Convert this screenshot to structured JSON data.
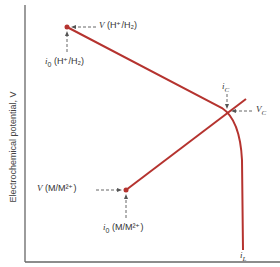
{
  "diagram": {
    "y_axis_label": "Electrochemical potential, V",
    "labels": {
      "v_h": "V (H⁺/H₂)",
      "i0_h": "i₀ (H⁺/H₂)",
      "ic": "i_C",
      "vc": "V_C",
      "v_m": "V (M/M²⁺)",
      "i0_m": "i₀ (M/M²⁺)",
      "il": "i_L"
    },
    "label_parts": {
      "v_h_v": "V",
      "v_h_rest": " (H⁺/H₂)",
      "i0_h_i": "i",
      "i0_h_sub": "0",
      "i0_h_rest": " (H⁺/H₂)",
      "ic_i": "i",
      "ic_sub": "C",
      "vc_v": "V",
      "vc_sub": "C",
      "v_m_v": "V",
      "v_m_rest": " (M/M²⁺)",
      "i0_m_i": "i",
      "i0_m_sub": "0",
      "i0_m_rest": " (M/M²⁺)",
      "il_i": "i",
      "il_sub": "L"
    },
    "colors": {
      "curve": "#b5332f",
      "axis": "#555555",
      "arrow": "#555555"
    }
  }
}
